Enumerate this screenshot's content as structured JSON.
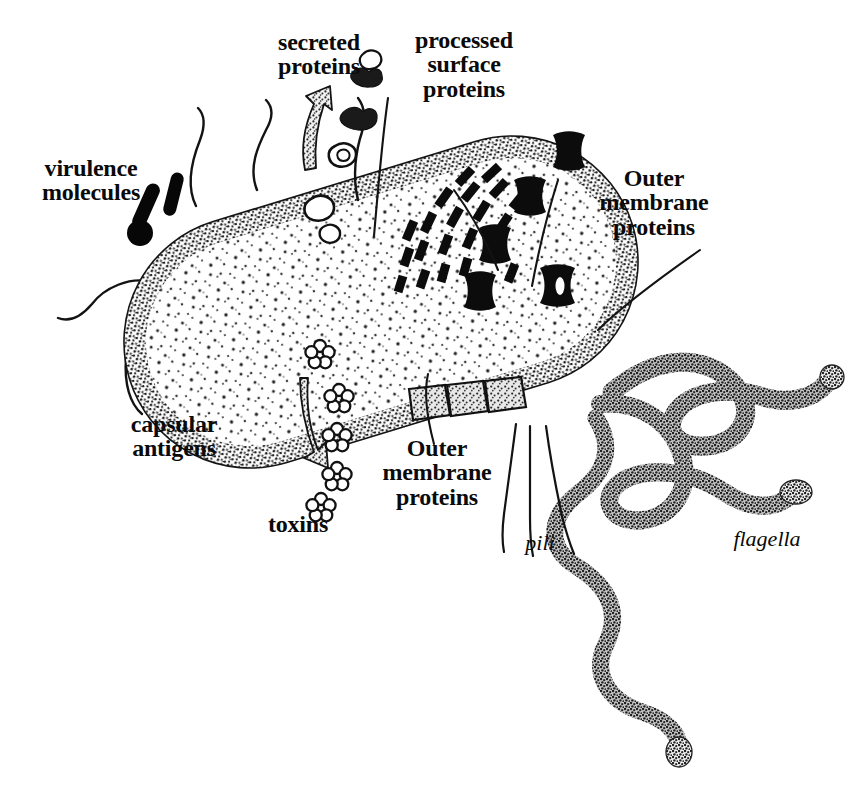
{
  "figure": {
    "background_color": "#ffffff",
    "ink_color": "#0a0a0a",
    "stipple_color": "#4a4a4a"
  },
  "labels": {
    "virulence_molecules": "virulence\nmolecules",
    "secreted_proteins": "secreted\nproteins",
    "processed_surface_proteins": "processed\nsurface\nproteins",
    "outer_membrane_proteins_right": "Outer\nmembrane\nproteins",
    "outer_membrane_proteins_bottom": "Outer\nmembrane\nproteins",
    "capsular_antigens": "capsular\nantigens",
    "toxins": "toxins",
    "pili": "pili",
    "flagella": "flagella"
  },
  "structures": [
    {
      "name": "cell-body",
      "description": "stippled rod-shaped bacterial cell",
      "count": 1
    },
    {
      "name": "virulence-molecule-rod",
      "description": "thick black rod",
      "count": 2
    },
    {
      "name": "virulence-molecule-sphere",
      "description": "filled black circle",
      "count": 1
    },
    {
      "name": "secreted-protein-blob",
      "description": "irregular blob",
      "count": 6
    },
    {
      "name": "secreted-proteins-arrow",
      "description": "upward tapered stippled arrow",
      "count": 1
    },
    {
      "name": "processed-surface-protein-dash",
      "description": "short black dash trail",
      "count": 21
    },
    {
      "name": "outer-membrane-protein-bowtie",
      "description": "black hourglass/bow-tie block",
      "count": 6
    },
    {
      "name": "outer-membrane-protein-block",
      "description": "outlined stippled membrane block",
      "count": 3
    },
    {
      "name": "capsular-antigen-mesh",
      "description": "crosshatch grid mesh",
      "count": 1
    },
    {
      "name": "toxin-flower",
      "description": "five-petal flower glyph",
      "count": 6
    },
    {
      "name": "toxins-arrow",
      "description": "downward curved stippled arrow",
      "count": 1
    },
    {
      "name": "pilus-filament",
      "description": "thin hair-like filament",
      "count": 7
    },
    {
      "name": "flagellum-filament",
      "description": "thick stippled wavy filament with bulb tip",
      "count": 3
    }
  ]
}
